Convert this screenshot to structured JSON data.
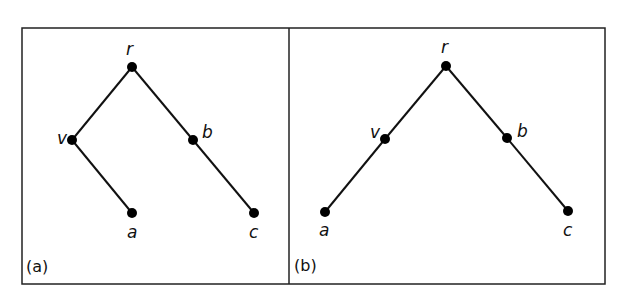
{
  "figure": {
    "panels": [
      {
        "label": "(a)",
        "nodes": [
          {
            "id": "r",
            "label": "r"
          },
          {
            "id": "v",
            "label": "v"
          },
          {
            "id": "b",
            "label": "b"
          },
          {
            "id": "a",
            "label": "a"
          },
          {
            "id": "c",
            "label": "c"
          }
        ],
        "edges": [
          [
            "r",
            "v"
          ],
          [
            "r",
            "b"
          ],
          [
            "v",
            "a"
          ],
          [
            "b",
            "c"
          ]
        ]
      },
      {
        "label": "(b)",
        "nodes": [
          {
            "id": "r",
            "label": "r"
          },
          {
            "id": "v",
            "label": "v"
          },
          {
            "id": "b",
            "label": "b"
          },
          {
            "id": "a",
            "label": "a"
          },
          {
            "id": "c",
            "label": "c"
          }
        ],
        "edges": [
          [
            "r",
            "v"
          ],
          [
            "r",
            "b"
          ],
          [
            "v",
            "a"
          ],
          [
            "b",
            "c"
          ]
        ]
      }
    ]
  }
}
